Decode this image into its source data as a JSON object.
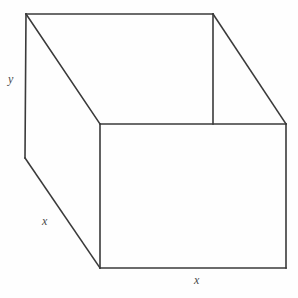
{
  "figure": {
    "background_color": "#fefefe",
    "stroke_color": "#3a3a3a",
    "label_color": "#4a4a4a",
    "labels": {
      "height": "y",
      "depth": "x",
      "width": "x"
    },
    "vertices": {
      "back_top_left": [
        26,
        14
      ],
      "back_top_right": [
        213,
        14
      ],
      "front_top_left": [
        100,
        124
      ],
      "front_top_right": [
        286,
        124
      ],
      "back_bottom_left": [
        25,
        158
      ],
      "front_bottom_left": [
        100,
        268
      ],
      "front_bottom_right": [
        286,
        268
      ]
    },
    "edges": [
      {
        "name": "back-top-edge",
        "from": "back_top_left",
        "to": "back_top_right"
      },
      {
        "name": "back-right-rim-edge",
        "from": "back_top_right",
        "to": "front_top_right"
      },
      {
        "name": "front-top-rim-edge",
        "from": "front_top_left",
        "to": "front_top_right"
      },
      {
        "name": "left-rim-diagonal-edge",
        "from": "back_top_left",
        "to": "front_top_left"
      },
      {
        "name": "back-right-vertical-edge",
        "from": "back_top_right",
        "to": [
          213,
          124
        ]
      },
      {
        "name": "left-vertical-edge",
        "from": "back_top_left",
        "to": "back_bottom_left"
      },
      {
        "name": "bottom-left-diagonal-edge",
        "from": "back_bottom_left",
        "to": "front_bottom_left"
      },
      {
        "name": "front-left-vertical-edge",
        "from": "front_top_left",
        "to": "front_bottom_left"
      },
      {
        "name": "front-bottom-edge",
        "from": "front_bottom_left",
        "to": "front_bottom_right"
      },
      {
        "name": "front-right-vertical-edge",
        "from": "front_top_right",
        "to": "front_bottom_right"
      }
    ]
  }
}
